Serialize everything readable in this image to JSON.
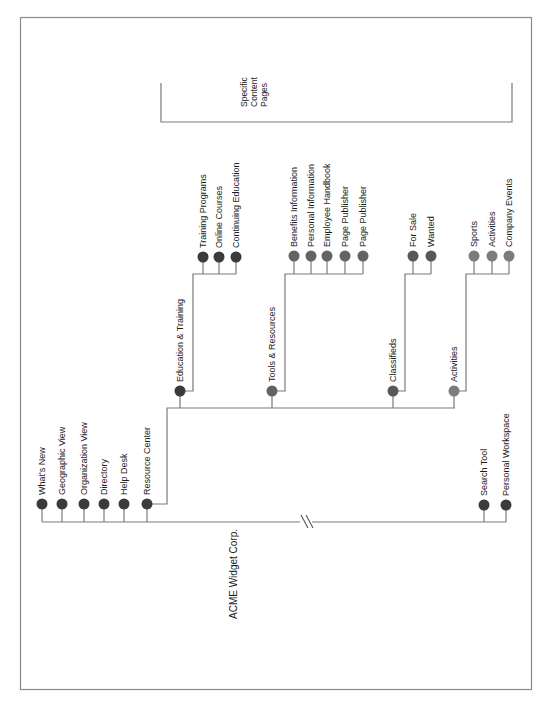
{
  "diagram": {
    "root": {
      "label": "ACME Widget Corp."
    },
    "annotation": {
      "label": "Specific\nContent\nPages"
    },
    "colors": {
      "border": "#8a8a8a",
      "line": "#7a7a7a",
      "dot_dark": "#3b3b3b",
      "dot_tools": "#636363",
      "dot_classifieds": "#585858",
      "dot_activities": "#7c7c7c"
    },
    "top_level": [
      {
        "label": "What's New",
        "x": 42
      },
      {
        "label": "Geographic View",
        "x": 62
      },
      {
        "label": "Organization View",
        "x": 84
      },
      {
        "label": "Directory",
        "x": 104
      },
      {
        "label": "Help Desk",
        "x": 124
      },
      {
        "label": "Resource Center",
        "x": 147
      },
      {
        "label": "Search Tool",
        "x": 484
      },
      {
        "label": "Personal Workspace",
        "x": 506
      }
    ],
    "resource_center_sections": [
      {
        "label": "Education & Training",
        "x": 180,
        "children": [
          {
            "label": "Training Programs",
            "x": 203
          },
          {
            "label": "Online Courses",
            "x": 219
          },
          {
            "label": "Continuing Education",
            "x": 236
          }
        ]
      },
      {
        "label": "Tools & Resources",
        "x": 272,
        "children": [
          {
            "label": "Benefits Information",
            "x": 294
          },
          {
            "label": "Personal Information",
            "x": 311
          },
          {
            "label": "Employee Handbook",
            "x": 327
          },
          {
            "label": "Page Publisher",
            "x": 345
          },
          {
            "label": "Page Publisher",
            "x": 363
          }
        ]
      },
      {
        "label": "Classifieds",
        "x": 393,
        "children": [
          {
            "label": "For Sale",
            "x": 413
          },
          {
            "label": "Wanted",
            "x": 431
          }
        ]
      },
      {
        "label": "Activities",
        "x": 454,
        "children": [
          {
            "label": "Sports",
            "x": 474
          },
          {
            "label": "Activities",
            "x": 492
          },
          {
            "label": "Company Events",
            "x": 509
          }
        ]
      }
    ],
    "break_mark": "//"
  }
}
